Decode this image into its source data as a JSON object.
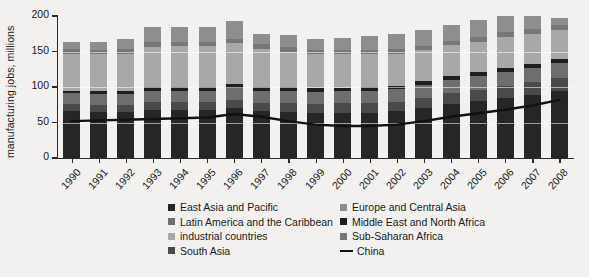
{
  "top_cropped_fragments": [
    {
      "text": "▪",
      "left": 318
    },
    {
      "text": "▪",
      "left": 432
    },
    {
      "text": "▪",
      "left": 468
    },
    {
      "text": "▪",
      "left": 530
    }
  ],
  "axes": {
    "y_title": "manufacturing jobs, millions",
    "y_ticks": [
      0,
      50,
      100,
      150,
      200
    ],
    "y_min": 0,
    "y_max": 200,
    "x_labels": [
      "1990",
      "1991",
      "1992",
      "1993",
      "1994",
      "1995",
      "1996",
      "1997",
      "1998",
      "1999",
      "2000",
      "2001",
      "2002",
      "2003",
      "2004",
      "2005",
      "2006",
      "2007",
      "2008"
    ]
  },
  "colors": {
    "background": "#f2f1ef",
    "axis": "#2b2b2b",
    "east_asia_and_pacific": "#262626",
    "europe_and_central_asia": "#8e8e8e",
    "latin_america_and_the_caribbean": "#6e6e6e",
    "middle_east_and_north_africa": "#1e1e1e",
    "industrial_countries": "#a8a8a8",
    "sub_saharan_africa": "#777777",
    "south_asia": "#4a4a4a",
    "china_line": "#111111"
  },
  "legend": {
    "left_column": [
      {
        "label": "East Asia and Pacific",
        "key": "east_asia_and_pacific",
        "type": "swatch"
      },
      {
        "label": "Latin America and the Caribbean",
        "key": "latin_america_and_the_caribbean",
        "type": "swatch"
      },
      {
        "label": "industrial countries",
        "key": "industrial_countries",
        "type": "swatch"
      },
      {
        "label": "South Asia",
        "key": "south_asia",
        "type": "swatch"
      }
    ],
    "right_column": [
      {
        "label": "Europe and Central Asia",
        "key": "europe_and_central_asia",
        "type": "swatch"
      },
      {
        "label": "Middle East and North Africa",
        "key": "middle_east_and_north_africa",
        "type": "swatch"
      },
      {
        "label": "Sub-Saharan Africa",
        "key": "sub_saharan_africa",
        "type": "swatch"
      },
      {
        "label": "China",
        "key": "china_line",
        "type": "line"
      }
    ]
  },
  "chart_data": {
    "type": "bar",
    "subtype": "stacked-bar-with-overlay-line",
    "title": "",
    "xlabel": "",
    "ylabel": "manufacturing jobs, millions",
    "ylim": [
      0,
      200
    ],
    "grid": false,
    "legend_position": "bottom",
    "categories": [
      "1990",
      "1991",
      "1992",
      "1993",
      "1994",
      "1995",
      "1996",
      "1997",
      "1998",
      "1999",
      "2000",
      "2001",
      "2002",
      "2003",
      "2004",
      "2005",
      "2006",
      "2007",
      "2008"
    ],
    "stack_order": [
      "East Asia and Pacific",
      "South Asia",
      "Latin America and the Caribbean",
      "Middle East and North Africa",
      "industrial countries",
      "Sub-Saharan Africa",
      "Europe and Central Asia"
    ],
    "series": [
      {
        "name": "East Asia and Pacific",
        "color": "#262626",
        "values": [
          66,
          65,
          65,
          68,
          68,
          68,
          70,
          66,
          65,
          63,
          64,
          64,
          66,
          71,
          76,
          80,
          84,
          89,
          94
        ]
      },
      {
        "name": "South Asia",
        "color": "#4a4a4a",
        "values": [
          10,
          10,
          10,
          11,
          11,
          11,
          12,
          12,
          13,
          13,
          13,
          13,
          13,
          14,
          15,
          16,
          17,
          18,
          19
        ]
      },
      {
        "name": "Latin America and the Caribbean",
        "color": "#6e6e6e",
        "values": [
          15,
          15,
          15,
          16,
          16,
          16,
          17,
          17,
          17,
          17,
          17,
          18,
          18,
          18,
          19,
          19,
          20,
          20,
          21
        ]
      },
      {
        "name": "Middle East and North Africa",
        "color": "#1e1e1e",
        "values": [
          4,
          4,
          5,
          5,
          5,
          5,
          5,
          5,
          5,
          5,
          5,
          5,
          5,
          5,
          5,
          6,
          6,
          6,
          6
        ]
      },
      {
        "name": "industrial countries",
        "color": "#a8a8a8",
        "values": [
          52,
          52,
          52,
          57,
          58,
          58,
          58,
          54,
          50,
          48,
          47,
          46,
          45,
          44,
          44,
          43,
          43,
          42,
          41
        ]
      },
      {
        "name": "Sub-Saharan Africa",
        "color": "#777777",
        "values": [
          6,
          6,
          6,
          6,
          6,
          6,
          6,
          6,
          6,
          6,
          6,
          6,
          6,
          6,
          6,
          7,
          7,
          7,
          7
        ]
      },
      {
        "name": "Europe and Central Asia",
        "color": "#8e8e8e",
        "values": [
          11,
          12,
          15,
          22,
          21,
          21,
          25,
          15,
          17,
          16,
          17,
          20,
          21,
          22,
          22,
          23,
          23,
          18,
          9
        ]
      }
    ],
    "totals": [
      164,
      164,
      168,
      185,
      185,
      185,
      193,
      175,
      173,
      168,
      169,
      172,
      174,
      180,
      187,
      194,
      200,
      200,
      197
    ],
    "overlay_line": {
      "name": "China",
      "color": "#111111",
      "values": [
        52,
        53,
        54,
        55,
        56,
        57,
        62,
        58,
        52,
        47,
        45,
        45,
        47,
        52,
        58,
        63,
        68,
        74,
        82
      ]
    }
  }
}
